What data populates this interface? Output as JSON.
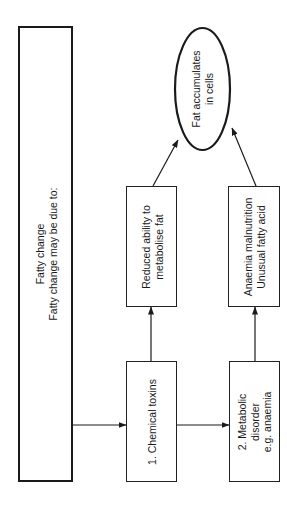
{
  "diagram": {
    "orientation": "rotated-90-ccw",
    "main_box": {
      "lines": [
        "Fatty change",
        "Fatty change may be due to:"
      ]
    },
    "causes": [
      {
        "lines": [
          "1. Chemical toxins"
        ],
        "effect": {
          "lines": [
            "Reduced ability to",
            "metabolise fat"
          ]
        }
      },
      {
        "lines": [
          "2. Metabolic",
          "disorder",
          "e.g. anaemia"
        ],
        "effect": {
          "lines": [
            "Anaemia malnutrition",
            "Unusual fatty acid"
          ]
        }
      }
    ],
    "outcome": {
      "lines": [
        "Fat accumulates",
        "in cells"
      ]
    },
    "edges": [
      {
        "from": "main_box",
        "to": "cause_1"
      },
      {
        "from": "cause_1",
        "to": "cause_2"
      },
      {
        "from": "cause_1",
        "to": "effect_1"
      },
      {
        "from": "cause_2",
        "to": "effect_2"
      },
      {
        "from": "effect_1",
        "to": "outcome"
      },
      {
        "from": "effect_2",
        "to": "outcome"
      }
    ]
  }
}
